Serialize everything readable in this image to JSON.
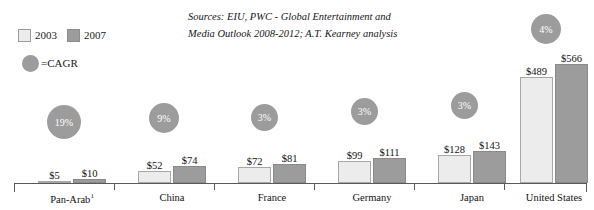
{
  "legend": {
    "series": [
      {
        "key": "y2003",
        "label": "2003",
        "swatch": "light",
        "color": "#ececec"
      },
      {
        "key": "y2007",
        "label": "2007",
        "swatch": "dark",
        "color": "#9c9c9c"
      }
    ],
    "cagr": {
      "marker": "cagr-bubble-icon",
      "label": "=CAGR",
      "color": "#9c9c9c"
    }
  },
  "source": {
    "line1": "Sources: EIU, PWC - Global Entertainment and",
    "line2": "Media Outlook 2008-2012; A.T. Kearney analysis"
  },
  "chart_data": {
    "type": "bar",
    "title": "",
    "xlabel": "",
    "ylabel": "",
    "ylim": [
      0,
      620
    ],
    "grid": false,
    "legend_position": "top-left",
    "categories": [
      "Pan-Arab¹",
      "China",
      "France",
      "Germany",
      "Japan",
      "United States"
    ],
    "series": [
      {
        "name": "2003",
        "values": [
          5,
          52,
          72,
          99,
          128,
          489
        ]
      },
      {
        "name": "2007",
        "values": [
          10,
          74,
          81,
          111,
          143,
          566
        ]
      }
    ],
    "value_labels": {
      "2003": [
        "$5",
        "$52",
        "$72",
        "$99",
        "$128",
        "$489"
      ],
      "2007": [
        "$10",
        "$74",
        "$81",
        "$111",
        "$143",
        "$566"
      ]
    },
    "annotations": [
      {
        "category": "Pan-Arab¹",
        "type": "cagr-bubble",
        "label": "19%",
        "value": 19
      },
      {
        "category": "China",
        "type": "cagr-bubble",
        "label": "9%",
        "value": 9
      },
      {
        "category": "France",
        "type": "cagr-bubble",
        "label": "3%",
        "value": 3
      },
      {
        "category": "Germany",
        "type": "cagr-bubble",
        "label": "3%",
        "value": 3
      },
      {
        "category": "Japan",
        "type": "cagr-bubble",
        "label": "3%",
        "value": 3
      },
      {
        "category": "United States",
        "type": "cagr-bubble",
        "label": "4%",
        "value": 4
      }
    ]
  },
  "groups": [
    {
      "name": "Pan-Arab¹",
      "label_html": "Pan-Arab",
      "sup": "1",
      "v2003": "$5",
      "v2007": "$10",
      "cagr": "19%",
      "left": 12,
      "width": 92,
      "h2003": 2,
      "h2007": 4,
      "bubble": 34,
      "bubble_left": 21,
      "bubble_bottom": 44
    },
    {
      "name": "China",
      "label_html": "China",
      "sup": "",
      "v2003": "$52",
      "v2007": "$74",
      "cagr": "9%",
      "left": 112,
      "width": 92,
      "h2003": 12,
      "h2007": 17,
      "bubble": 30,
      "bubble_left": 23,
      "bubble_bottom": 50
    },
    {
      "name": "France",
      "label_html": "France",
      "sup": "",
      "v2003": "$72",
      "v2007": "$81",
      "cagr": "3%",
      "left": 212,
      "width": 92,
      "h2003": 16,
      "h2007": 19,
      "bubble": 27,
      "bubble_left": 25,
      "bubble_bottom": 52
    },
    {
      "name": "Germany",
      "label_html": "Germany",
      "sup": "",
      "v2003": "$99",
      "v2007": "$111",
      "cagr": "3%",
      "left": 312,
      "width": 92,
      "h2003": 22,
      "h2007": 25,
      "bubble": 27,
      "bubble_left": 25,
      "bubble_bottom": 58
    },
    {
      "name": "Japan",
      "label_html": "Japan",
      "sup": "",
      "v2003": "$128",
      "v2007": "$143",
      "cagr": "3%",
      "left": 412,
      "width": 92,
      "h2003": 28,
      "h2007": 32,
      "bubble": 27,
      "bubble_left": 25,
      "bubble_bottom": 64
    },
    {
      "name": "United States",
      "label_html": "United States",
      "sup": "",
      "v2003": "$489",
      "v2007": "$566",
      "cagr": "4%",
      "left": 494,
      "width": 92,
      "h2003": 106,
      "h2007": 119,
      "bubble": 30,
      "bubble_left": 23,
      "bubble_bottom": 139
    }
  ],
  "axis": {
    "ticks": [
      0,
      100,
      200,
      300,
      400,
      490,
      572
    ]
  }
}
